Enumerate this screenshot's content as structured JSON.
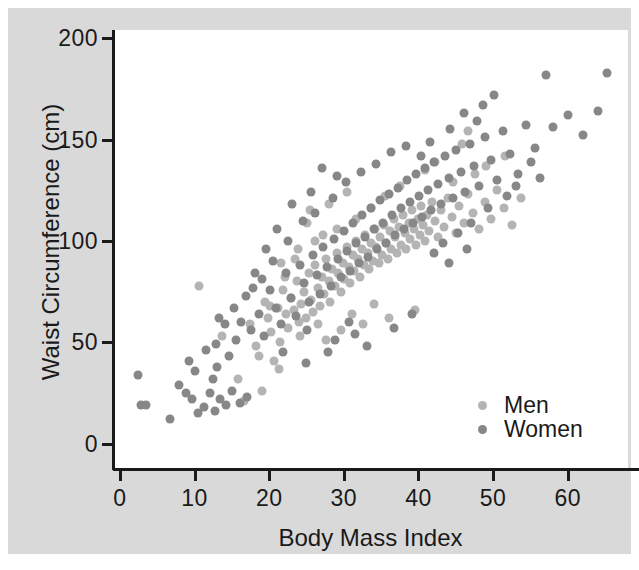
{
  "chart_data": {
    "type": "scatter",
    "title": "",
    "xlabel": "Body Mass Index",
    "ylabel": "Waist Circumference (cm)",
    "xlim": [
      -2,
      67
    ],
    "ylim": [
      -8,
      208
    ],
    "xticks": [
      0,
      10,
      20,
      30,
      40,
      50,
      60
    ],
    "yticks": [
      0,
      50,
      100,
      150,
      200
    ],
    "grid": false,
    "legend_position": "lower-right-inside",
    "colors": {
      "men": "#b4b4b4",
      "women": "#878787",
      "axis": "#1a1a1a",
      "canvas": "#d9d9d9",
      "plot": "#ffffff"
    },
    "series": [
      {
        "name": "Men",
        "color": "#b4b4b4",
        "points": [
          [
            9.5,
            82
          ],
          [
            12.6,
            57
          ],
          [
            14.8,
            36
          ],
          [
            15.6,
            25
          ],
          [
            16.4,
            63
          ],
          [
            17.2,
            52
          ],
          [
            17.9,
            30
          ],
          [
            18.4,
            74
          ],
          [
            18.8,
            66
          ],
          [
            19.2,
            59
          ],
          [
            19.6,
            45
          ],
          [
            20.1,
            71
          ],
          [
            20.4,
            54
          ],
          [
            20.8,
            80
          ],
          [
            21.2,
            68
          ],
          [
            21.5,
            61
          ],
          [
            21.9,
            76
          ],
          [
            22.2,
            70
          ],
          [
            22.6,
            84
          ],
          [
            22.9,
            64
          ],
          [
            23.2,
            73
          ],
          [
            23.6,
            79
          ],
          [
            23.9,
            66
          ],
          [
            24.2,
            88
          ],
          [
            24.5,
            75
          ],
          [
            24.8,
            69
          ],
          [
            25.1,
            92
          ],
          [
            25.4,
            81
          ],
          [
            25.7,
            72
          ],
          [
            26.0,
            86
          ],
          [
            26.3,
            78
          ],
          [
            26.6,
            95
          ],
          [
            26.9,
            84
          ],
          [
            27.1,
            74
          ],
          [
            27.4,
            90
          ],
          [
            27.7,
            82
          ],
          [
            28.0,
            98
          ],
          [
            28.2,
            88
          ],
          [
            28.5,
            79
          ],
          [
            28.8,
            93
          ],
          [
            29.0,
            85
          ],
          [
            29.3,
            101
          ],
          [
            29.6,
            91
          ],
          [
            29.8,
            83
          ],
          [
            30.1,
            97
          ],
          [
            30.3,
            89
          ],
          [
            30.6,
            104
          ],
          [
            30.8,
            95
          ],
          [
            31.1,
            86
          ],
          [
            31.3,
            100
          ],
          [
            31.6,
            92
          ],
          [
            31.8,
            107
          ],
          [
            32.1,
            98
          ],
          [
            32.3,
            90
          ],
          [
            32.6,
            103
          ],
          [
            32.8,
            94
          ],
          [
            33.1,
            110
          ],
          [
            33.3,
            101
          ],
          [
            33.6,
            93
          ],
          [
            33.8,
            106
          ],
          [
            34.1,
            97
          ],
          [
            34.3,
            112
          ],
          [
            34.6,
            103
          ],
          [
            34.8,
            95
          ],
          [
            35.1,
            109
          ],
          [
            35.3,
            100
          ],
          [
            35.6,
            115
          ],
          [
            35.8,
            106
          ],
          [
            36.1,
            98
          ],
          [
            36.3,
            111
          ],
          [
            36.6,
            102
          ],
          [
            36.8,
            117
          ],
          [
            37.1,
            108
          ],
          [
            37.3,
            100
          ],
          [
            37.6,
            113
          ],
          [
            37.8,
            105
          ],
          [
            38.1,
            119
          ],
          [
            38.3,
            110
          ],
          [
            38.6,
            102
          ],
          [
            38.8,
            115
          ],
          [
            39.1,
            107
          ],
          [
            39.3,
            121
          ],
          [
            39.6,
            112
          ],
          [
            39.8,
            104
          ],
          [
            40.1,
            117
          ],
          [
            40.4,
            109
          ],
          [
            40.8,
            123
          ],
          [
            41.2,
            114
          ],
          [
            41.6,
            106
          ],
          [
            42.0,
            119
          ],
          [
            42.4,
            111
          ],
          [
            42.9,
            125
          ],
          [
            43.4,
            116
          ],
          [
            43.9,
            108
          ],
          [
            44.4,
            121
          ],
          [
            45.0,
            113
          ],
          [
            45.6,
            127
          ],
          [
            46.2,
            118
          ],
          [
            47.0,
            110
          ],
          [
            47.8,
            123
          ],
          [
            48.6,
            115
          ],
          [
            49.5,
            129
          ],
          [
            50.4,
            120
          ],
          [
            51.5,
            112
          ],
          [
            52.6,
            125
          ],
          [
            44.8,
            152
          ],
          [
            45.6,
            158
          ],
          [
            41.2,
            143
          ],
          [
            39.8,
            139
          ],
          [
            27.0,
            122
          ],
          [
            24.0,
            113
          ],
          [
            26.2,
            107
          ],
          [
            21.0,
            86
          ],
          [
            22.4,
            95
          ],
          [
            19.0,
            72
          ],
          [
            17.6,
            47
          ],
          [
            20.2,
            41
          ],
          [
            23.0,
            57
          ],
          [
            25.5,
            63
          ],
          [
            30.0,
            68
          ],
          [
            33.0,
            73
          ],
          [
            35.0,
            66
          ],
          [
            38.5,
            70
          ],
          [
            31.5,
            63
          ],
          [
            28.5,
            60
          ],
          [
            26.5,
            55
          ],
          [
            43.5,
            133
          ],
          [
            46.5,
            137
          ],
          [
            48.0,
            141
          ],
          [
            50.5,
            146
          ],
          [
            36.5,
            131
          ],
          [
            34.5,
            126
          ],
          [
            32.5,
            120
          ],
          [
            30.5,
            115
          ],
          [
            28.0,
            110
          ],
          [
            25.0,
            104
          ],
          [
            22.8,
            100
          ],
          [
            20.5,
            93
          ],
          [
            24.4,
            119
          ],
          [
            29.4,
            128
          ]
        ]
      },
      {
        "name": "Women",
        "color": "#878787",
        "points": [
          [
            1.4,
            38
          ],
          [
            1.8,
            23
          ],
          [
            2.4,
            23
          ],
          [
            5.6,
            16
          ],
          [
            7.8,
            29
          ],
          [
            8.6,
            26
          ],
          [
            9.4,
            19
          ],
          [
            10.2,
            22
          ],
          [
            11.0,
            29
          ],
          [
            11.6,
            20
          ],
          [
            12.4,
            26
          ],
          [
            13.2,
            23
          ],
          [
            14.0,
            30
          ],
          [
            15.0,
            24
          ],
          [
            16.0,
            27
          ],
          [
            10.5,
            50
          ],
          [
            11.8,
            53
          ],
          [
            13.5,
            47
          ],
          [
            12.0,
            42
          ],
          [
            14.5,
            55
          ],
          [
            16.5,
            60
          ],
          [
            15.2,
            64
          ],
          [
            17.5,
            68
          ],
          [
            18.2,
            57
          ],
          [
            19.0,
            80
          ],
          [
            19.8,
            71
          ],
          [
            20.5,
            63
          ],
          [
            21.2,
            88
          ],
          [
            21.8,
            76
          ],
          [
            22.5,
            67
          ],
          [
            23.0,
            92
          ],
          [
            23.6,
            83
          ],
          [
            24.2,
            74
          ],
          [
            24.8,
            97
          ],
          [
            25.3,
            87
          ],
          [
            25.8,
            78
          ],
          [
            26.2,
            101
          ],
          [
            26.7,
            91
          ],
          [
            27.2,
            82
          ],
          [
            27.6,
            105
          ],
          [
            28.1,
            95
          ],
          [
            28.5,
            86
          ],
          [
            29.0,
            109
          ],
          [
            29.4,
            99
          ],
          [
            29.8,
            89
          ],
          [
            30.2,
            113
          ],
          [
            30.6,
            103
          ],
          [
            31.0,
            93
          ],
          [
            31.4,
            117
          ],
          [
            31.8,
            106
          ],
          [
            32.2,
            96
          ],
          [
            32.6,
            120
          ],
          [
            33.0,
            110
          ],
          [
            33.4,
            100
          ],
          [
            33.8,
            124
          ],
          [
            34.2,
            113
          ],
          [
            34.6,
            103
          ],
          [
            35.0,
            127
          ],
          [
            35.4,
            117
          ],
          [
            35.8,
            107
          ],
          [
            36.2,
            130
          ],
          [
            36.6,
            120
          ],
          [
            37.0,
            110
          ],
          [
            37.4,
            134
          ],
          [
            37.8,
            123
          ],
          [
            38.2,
            113
          ],
          [
            38.6,
            137
          ],
          [
            39.0,
            126
          ],
          [
            39.4,
            116
          ],
          [
            39.8,
            140
          ],
          [
            40.2,
            129
          ],
          [
            40.6,
            119
          ],
          [
            41.0,
            143
          ],
          [
            41.5,
            132
          ],
          [
            42.0,
            122
          ],
          [
            42.5,
            146
          ],
          [
            43.0,
            135
          ],
          [
            43.5,
            125
          ],
          [
            44.0,
            149
          ],
          [
            44.6,
            138
          ],
          [
            45.2,
            128
          ],
          [
            45.8,
            152
          ],
          [
            46.4,
            141
          ],
          [
            47.0,
            131
          ],
          [
            47.8,
            155
          ],
          [
            48.6,
            144
          ],
          [
            49.4,
            134
          ],
          [
            50.2,
            158
          ],
          [
            51.2,
            147
          ],
          [
            52.2,
            137
          ],
          [
            53.4,
            161
          ],
          [
            54.6,
            150
          ],
          [
            56.0,
            186
          ],
          [
            57.0,
            160
          ],
          [
            59.0,
            166
          ],
          [
            61.0,
            156
          ],
          [
            63.0,
            168
          ],
          [
            64.2,
            187
          ],
          [
            49.0,
            176
          ],
          [
            47.6,
            171
          ],
          [
            46.8,
            163
          ],
          [
            45.0,
            167
          ],
          [
            43.2,
            159
          ],
          [
            40.5,
            153
          ],
          [
            26.0,
            140
          ],
          [
            28.0,
            136
          ],
          [
            24.5,
            128
          ],
          [
            22.0,
            122
          ],
          [
            20.0,
            110
          ],
          [
            18.5,
            100
          ],
          [
            17.0,
            88
          ],
          [
            19.5,
            94
          ],
          [
            21.5,
            104
          ],
          [
            23.5,
            114
          ],
          [
            25.0,
            118
          ],
          [
            27.5,
            125
          ],
          [
            29.2,
            133
          ],
          [
            31.2,
            138
          ],
          [
            33.2,
            142
          ],
          [
            35.2,
            148
          ],
          [
            37.2,
            151
          ],
          [
            39.2,
            146
          ],
          [
            14.2,
            71
          ],
          [
            13.0,
            63
          ],
          [
            12.2,
            66
          ],
          [
            15.8,
            77
          ],
          [
            16.8,
            81
          ],
          [
            18.0,
            85
          ],
          [
            11.4,
            36
          ],
          [
            9.0,
            40
          ],
          [
            8.2,
            45
          ],
          [
            6.8,
            33
          ],
          [
            20.8,
            49
          ],
          [
            23.8,
            44
          ],
          [
            26.8,
            49
          ],
          [
            24.0,
            60
          ],
          [
            27.8,
            55
          ],
          [
            30.4,
            58
          ],
          [
            32.0,
            52
          ],
          [
            38.0,
            68
          ],
          [
            35.6,
            61
          ],
          [
            29.6,
            64
          ],
          [
            42.2,
            103
          ],
          [
            44.2,
            108
          ],
          [
            46.0,
            113
          ],
          [
            41.0,
            98
          ],
          [
            43.0,
            93
          ],
          [
            45.4,
            100
          ],
          [
            48.2,
            120
          ],
          [
            50.8,
            126
          ],
          [
            52.0,
            131
          ],
          [
            54.0,
            143
          ],
          [
            55.2,
            135
          ]
        ]
      }
    ]
  },
  "axes": {
    "y_title": "Waist Circumference (cm)",
    "x_title": "Body Mass Index",
    "y_tick_labels": [
      "0",
      "50",
      "100",
      "150",
      "200"
    ],
    "x_tick_labels": [
      "0",
      "10",
      "20",
      "30",
      "40",
      "50",
      "60"
    ]
  },
  "legend": {
    "entries": [
      {
        "label": "Men",
        "marker": "men"
      },
      {
        "label": "Women",
        "marker": "women"
      }
    ]
  }
}
